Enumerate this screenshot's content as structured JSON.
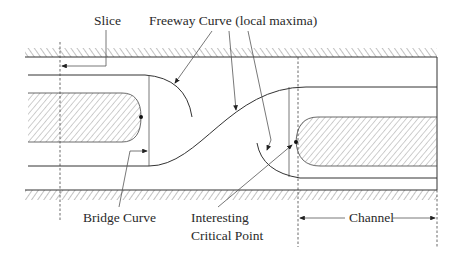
{
  "diagram": {
    "title": "",
    "labels": {
      "slice": "Slice",
      "freeway": "Freeway Curve (local maxima)",
      "bridge": "Bridge Curve",
      "critical_line1": "Interesting",
      "critical_line2": "Critical Point",
      "channel": "Channel"
    },
    "colors": {
      "line": "#333333",
      "hatch": "#555555",
      "background": "#ffffff"
    }
  }
}
